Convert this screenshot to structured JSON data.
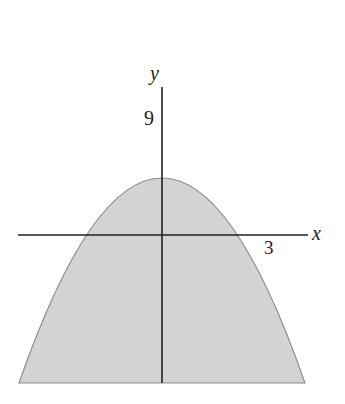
{
  "figure": {
    "equation": "y = 9 - x^2",
    "labels": {
      "x_axis": "x",
      "y_axis": "y",
      "y_intercept": "9",
      "x_intercept": "3"
    },
    "colors": {
      "fill": "#d2d2d2",
      "curve": "#8a8a8a",
      "axis": "#222222",
      "background": "#ffffff"
    }
  }
}
